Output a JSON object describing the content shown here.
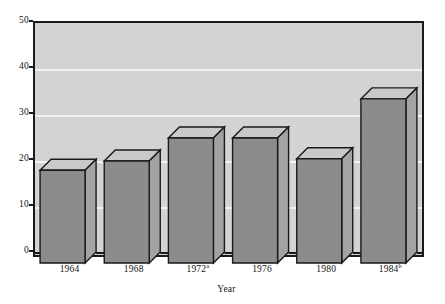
{
  "chart_data": {
    "type": "bar",
    "title": "",
    "subtitle": "",
    "xlabel": "Year",
    "ylabel": "",
    "categories": [
      "1964",
      "1968",
      "1972",
      "1976",
      "1980",
      "1984"
    ],
    "category_superscripts": [
      "",
      "",
      "a",
      "",
      "",
      "b"
    ],
    "category_labels_display": [
      "1964",
      "1968",
      "1972a",
      "1976",
      "1980",
      "1984b"
    ],
    "values": [
      18,
      20,
      25,
      25,
      20.5,
      33.5
    ],
    "series": [
      {
        "name": "",
        "values": [
          18,
          20,
          25,
          25,
          20.5,
          33.5
        ]
      }
    ],
    "ylim": [
      0,
      50
    ],
    "yticks": [
      0,
      10,
      20,
      30,
      40,
      50
    ],
    "ytick_labels": [
      "0",
      "10",
      "20",
      "30",
      "40",
      "50"
    ],
    "gridlines": [
      10,
      20,
      30,
      40
    ],
    "grid": true,
    "grid_axis": "y",
    "legend": false,
    "legend_position": "none",
    "style": "3d-bars",
    "colors": {
      "plot_background": "#d3d3d3",
      "page_background": "#ffffff",
      "bar_front": "#8c8c8c",
      "bar_top": "#c9c9c9",
      "bar_side": "#a3a3a3",
      "bar_outline": "#1a1a1a",
      "gridline": "#f2f2f2",
      "axis": "#1a1a1a",
      "text": "#111111"
    }
  },
  "axis": {
    "x_title": "Year"
  }
}
